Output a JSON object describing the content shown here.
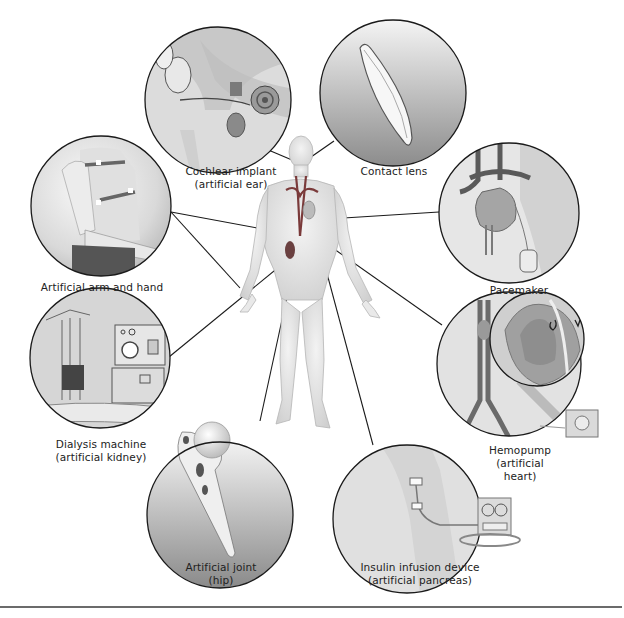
{
  "figure": {
    "center_figure": "human-body-anatomy",
    "callouts": [
      {
        "id": "cochlear",
        "lines": [
          "Cochlear implant",
          "(artificial ear)"
        ],
        "target": "ear"
      },
      {
        "id": "contact-lens",
        "lines": [
          "Contact lens"
        ],
        "target": "eye"
      },
      {
        "id": "pacemaker",
        "lines": [
          "Pacemaker"
        ],
        "target": "heart"
      },
      {
        "id": "arm",
        "lines": [
          "Artificial arm and hand"
        ],
        "target": "arm"
      },
      {
        "id": "hemopump",
        "lines": [
          "Hemopump",
          "(artificial",
          "heart)"
        ],
        "target": "heart"
      },
      {
        "id": "dialysis",
        "lines": [
          "Dialysis machine",
          "(artificial kidney)"
        ],
        "target": "kidney"
      },
      {
        "id": "hip",
        "lines": [
          "Artificial joint",
          "(hip)"
        ],
        "target": "hip"
      },
      {
        "id": "insulin",
        "lines": [
          "Insulin infusion device",
          "(artificial pancreas)"
        ],
        "target": "pancreas"
      }
    ]
  },
  "colors": {
    "outline": "#1a1a1a",
    "circle_fill_light": "#f2f2f2",
    "circle_fill_dark": "#9a9a9a",
    "vessel_red": "#7a3a3a",
    "skin": "#e4e4e4",
    "divider": "#6b6b6b"
  }
}
